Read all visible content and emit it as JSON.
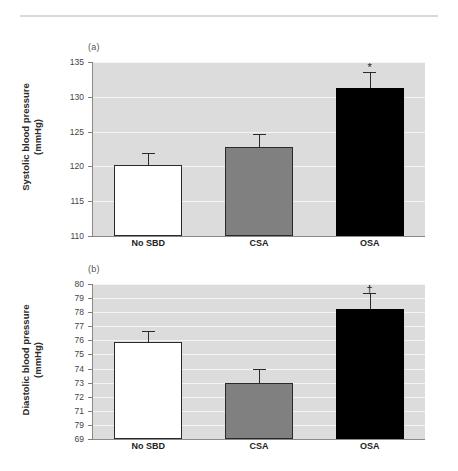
{
  "figure": {
    "panels": [
      {
        "id": "a",
        "label": "(a)",
        "axis_title_line1": "Systolic blood pressure",
        "axis_title_line2": "(mmHg)"
      },
      {
        "id": "b",
        "label": "(b)",
        "axis_title_line1": "Diastolic blood pressure",
        "axis_title_line2": "(mmHg)"
      }
    ]
  },
  "chart_data": [
    {
      "type": "bar",
      "panel": "(a)",
      "title": "",
      "xlabel": "",
      "ylabel": "Systolic blood pressure (mmHg)",
      "categories": [
        "No SBD",
        "CSA",
        "OSA"
      ],
      "values": [
        120.2,
        122.8,
        131.2
      ],
      "errors": [
        1.7,
        1.8,
        2.3
      ],
      "error_type": "error bar (upper only shown)",
      "bar_colors": [
        "#ffffff",
        "#808080",
        "#000000"
      ],
      "annotations": [
        {
          "category": "OSA",
          "symbol": "*"
        }
      ],
      "ylim": [
        110,
        135
      ],
      "ytick_step": 5,
      "ytick_labels": [
        "135",
        "130",
        "125",
        "120",
        "115",
        "110"
      ],
      "grid": true,
      "grid_color": "#f4f4f4",
      "plot_background": "#dcdcdc",
      "legend": "none"
    },
    {
      "type": "bar",
      "panel": "(b)",
      "title": "",
      "xlabel": "",
      "ylabel": "Diastolic blood pressure (mmHg)",
      "categories": [
        "No SBD",
        "CSA",
        "OSA"
      ],
      "values": [
        75.9,
        73.0,
        78.25
      ],
      "errors": [
        0.8,
        0.95,
        1.1
      ],
      "error_type": "error bar (upper only shown)",
      "bar_colors": [
        "#ffffff",
        "#808080",
        "#000000"
      ],
      "annotations": [
        {
          "category": "OSA",
          "symbol": "†"
        }
      ],
      "ylim": [
        69,
        80
      ],
      "ytick_step": 1,
      "ytick_labels": [
        "80",
        "79",
        "78",
        "77",
        "76",
        "75",
        "74",
        "73",
        "72",
        "71",
        "79",
        "69"
      ],
      "grid": true,
      "grid_color": "#f4f4f4",
      "plot_background": "#dcdcdc",
      "legend": "none"
    }
  ]
}
